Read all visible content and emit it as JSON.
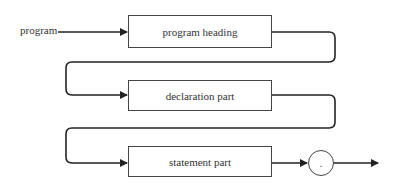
{
  "diagram": {
    "type": "syntax-diagram",
    "entry_label": "program",
    "nodes": [
      {
        "id": "program-heading",
        "label": "program heading",
        "kind": "non-terminal"
      },
      {
        "id": "declaration-part",
        "label": "declaration part",
        "kind": "non-terminal"
      },
      {
        "id": "statement-part",
        "label": "statement part",
        "kind": "non-terminal"
      },
      {
        "id": "period",
        "label": ".",
        "kind": "terminal"
      }
    ],
    "edges": [
      {
        "from": "entry",
        "to": "program-heading"
      },
      {
        "from": "program-heading",
        "to": "declaration-part"
      },
      {
        "from": "declaration-part",
        "to": "statement-part"
      },
      {
        "from": "statement-part",
        "to": "period"
      },
      {
        "from": "period",
        "to": "exit"
      }
    ],
    "colors": {
      "line": "#222222",
      "box_border": "#444444",
      "text": "#333333"
    }
  }
}
